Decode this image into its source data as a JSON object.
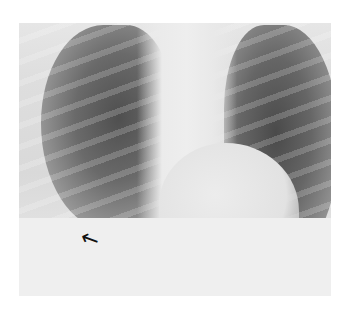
{
  "image": {
    "type": "chest-radiograph",
    "view": "frontal",
    "annotations": [
      {
        "kind": "arrow",
        "icon": "arrow-up-left-icon",
        "position": "right lower hemithorax near diaphragm",
        "color": "#111111"
      }
    ]
  }
}
